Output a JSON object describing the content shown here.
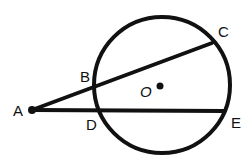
{
  "diagram": {
    "type": "geometry-secant-circle",
    "colors": {
      "stroke": "#111111",
      "background": "#ffffff"
    },
    "circle": {
      "center_label": "O",
      "cx": 162,
      "cy": 85,
      "r": 68
    },
    "points": {
      "A": {
        "label": "A",
        "x": 32,
        "y": 110
      },
      "B": {
        "label": "B",
        "x": 95,
        "y": 88
      },
      "C": {
        "label": "C",
        "x": 212,
        "y": 43
      },
      "D": {
        "label": "D",
        "x": 97,
        "y": 111
      },
      "E": {
        "label": "E",
        "x": 224,
        "y": 111
      },
      "O": {
        "label": "O",
        "x": 160,
        "y": 86
      }
    },
    "segments": [
      {
        "name": "secant-ABC",
        "from": "A",
        "to": "C"
      },
      {
        "name": "secant-ADE",
        "from": "A",
        "to": "E"
      }
    ]
  }
}
